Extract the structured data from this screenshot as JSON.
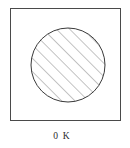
{
  "figure": {
    "caption": "0 K",
    "box": {
      "x": 10,
      "y": 8,
      "width": 111,
      "height": 113,
      "border_color": "#4a4a4a",
      "fill_color": "#ffffff"
    },
    "circle": {
      "center_x": 68,
      "center_y": 65,
      "radius": 37,
      "stroke_color": "#3a3a3a",
      "fill_label": "diagonal-hatch"
    },
    "hatch": {
      "angle_degrees": 45,
      "direction": "lower-left-to-upper-right",
      "spacing_px": 6.6,
      "stroke_color": "#7b7b7b",
      "stroke_width": 0.9
    },
    "background_color": "#ffffff",
    "text_color": "#2b2b2b"
  }
}
